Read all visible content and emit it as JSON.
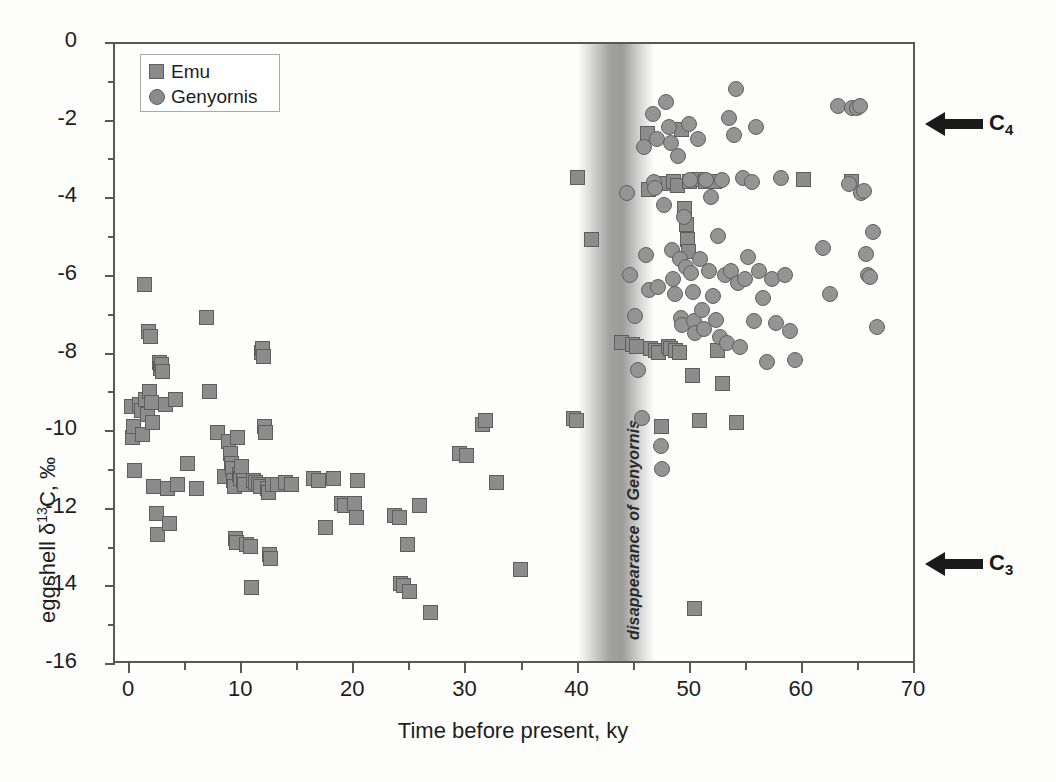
{
  "chart_data": {
    "type": "scatter",
    "title": "",
    "xlabel": "Time before present, ky",
    "ylabel": "eggshell δ13C, ‰",
    "xlim": [
      0,
      70
    ],
    "ylim": [
      -16,
      0
    ],
    "xticks": [
      0,
      10,
      20,
      30,
      40,
      50,
      60,
      70
    ],
    "yticks": [
      0,
      -2,
      -4,
      -6,
      -8,
      -10,
      -12,
      -14,
      -16
    ],
    "xtick_minor_step": 5,
    "ytick_minor_step": 1,
    "grid": false,
    "legend_position": "top-left",
    "series": [
      {
        "name": "Emu",
        "marker": "square",
        "color": "#8c8c8c",
        "points": [
          [
            0.3,
            -9.4
          ],
          [
            0.4,
            -10.2
          ],
          [
            0.5,
            -9.9
          ],
          [
            0.6,
            -11.05
          ],
          [
            1.0,
            -9.35
          ],
          [
            1.2,
            -9.5
          ],
          [
            1.3,
            -10.1
          ],
          [
            1.5,
            -6.25
          ],
          [
            1.6,
            -9.2
          ],
          [
            1.7,
            -9.6
          ],
          [
            1.8,
            -7.45
          ],
          [
            1.9,
            -9.0
          ],
          [
            2.0,
            -7.6
          ],
          [
            2.1,
            -9.3
          ],
          [
            2.2,
            -9.8
          ],
          [
            2.3,
            -11.45
          ],
          [
            2.5,
            -12.15
          ],
          [
            2.6,
            -12.7
          ],
          [
            2.8,
            -8.25
          ],
          [
            2.9,
            -8.4
          ],
          [
            3.0,
            -8.3
          ],
          [
            3.1,
            -8.5
          ],
          [
            3.3,
            -9.35
          ],
          [
            3.5,
            -11.5
          ],
          [
            3.7,
            -12.4
          ],
          [
            4.2,
            -9.2
          ],
          [
            4.4,
            -11.4
          ],
          [
            5.3,
            -10.85
          ],
          [
            6.1,
            -11.5
          ],
          [
            7.0,
            -7.1
          ],
          [
            7.3,
            -9.0
          ],
          [
            8.0,
            -10.05
          ],
          [
            8.6,
            -11.2
          ],
          [
            9.0,
            -10.3
          ],
          [
            9.1,
            -10.6
          ],
          [
            9.2,
            -10.85
          ],
          [
            9.3,
            -11.0
          ],
          [
            9.4,
            -11.3
          ],
          [
            9.5,
            -11.45
          ],
          [
            9.6,
            -12.8
          ],
          [
            9.7,
            -12.9
          ],
          [
            9.8,
            -10.2
          ],
          [
            9.9,
            -11.15
          ],
          [
            10.0,
            -11.25
          ],
          [
            10.1,
            -10.95
          ],
          [
            10.3,
            -11.3
          ],
          [
            10.4,
            -11.4
          ],
          [
            10.6,
            -12.95
          ],
          [
            10.9,
            -13.0
          ],
          [
            11.0,
            -14.05
          ],
          [
            11.2,
            -11.3
          ],
          [
            11.4,
            -11.35
          ],
          [
            11.6,
            -11.4
          ],
          [
            11.8,
            -11.45
          ],
          [
            11.9,
            -8.0
          ],
          [
            12.0,
            -7.9
          ],
          [
            12.1,
            -8.1
          ],
          [
            12.2,
            -9.9
          ],
          [
            12.3,
            -10.05
          ],
          [
            12.4,
            -11.5
          ],
          [
            12.5,
            -11.6
          ],
          [
            12.6,
            -13.2
          ],
          [
            12.7,
            -13.3
          ],
          [
            12.9,
            -11.4
          ],
          [
            13.3,
            -11.4
          ],
          [
            14.0,
            -11.35
          ],
          [
            14.6,
            -11.4
          ],
          [
            16.5,
            -11.25
          ],
          [
            17.0,
            -11.3
          ],
          [
            17.6,
            -12.5
          ],
          [
            18.3,
            -11.25
          ],
          [
            19.0,
            -11.9
          ],
          [
            19.3,
            -11.95
          ],
          [
            20.2,
            -11.9
          ],
          [
            20.4,
            -12.25
          ],
          [
            20.5,
            -11.3
          ],
          [
            23.8,
            -12.2
          ],
          [
            24.2,
            -12.25
          ],
          [
            24.3,
            -13.95
          ],
          [
            24.6,
            -14.0
          ],
          [
            24.9,
            -12.95
          ],
          [
            25.1,
            -14.15
          ],
          [
            26.0,
            -11.95
          ],
          [
            27.0,
            -14.7
          ],
          [
            29.6,
            -10.6
          ],
          [
            30.2,
            -10.65
          ],
          [
            31.6,
            -9.85
          ],
          [
            31.9,
            -9.75
          ],
          [
            32.9,
            -11.35
          ],
          [
            35.0,
            -13.6
          ],
          [
            39.7,
            -9.7
          ],
          [
            40.0,
            -9.75
          ],
          [
            40.1,
            -3.5
          ],
          [
            41.3,
            -5.1
          ],
          [
            44.0,
            -7.75
          ],
          [
            45.0,
            -7.8
          ],
          [
            45.3,
            -7.85
          ],
          [
            46.3,
            -2.35
          ],
          [
            46.4,
            -3.8
          ],
          [
            46.6,
            -7.9
          ],
          [
            47.0,
            -7.95
          ],
          [
            47.3,
            -8.0
          ],
          [
            47.6,
            -9.9
          ],
          [
            48.0,
            -3.65
          ],
          [
            48.2,
            -7.85
          ],
          [
            48.4,
            -7.9
          ],
          [
            48.6,
            -3.6
          ],
          [
            48.8,
            -7.95
          ],
          [
            49.0,
            -3.7
          ],
          [
            49.2,
            -8.0
          ],
          [
            49.4,
            -2.25
          ],
          [
            49.6,
            -4.3
          ],
          [
            49.8,
            -4.7
          ],
          [
            49.9,
            -5.1
          ],
          [
            50.0,
            -5.4
          ],
          [
            50.1,
            -3.6
          ],
          [
            50.3,
            -8.6
          ],
          [
            50.5,
            -14.6
          ],
          [
            50.8,
            -3.55
          ],
          [
            51.0,
            -9.75
          ],
          [
            51.5,
            -3.6
          ],
          [
            52.3,
            -3.6
          ],
          [
            52.6,
            -7.95
          ],
          [
            53.0,
            -8.8
          ],
          [
            54.3,
            -9.8
          ],
          [
            60.2,
            -3.55
          ],
          [
            64.5,
            -3.6
          ]
        ]
      },
      {
        "name": "Genyornis",
        "marker": "circle",
        "color": "#949494",
        "points": [
          [
            44.5,
            -3.9
          ],
          [
            44.8,
            -6.0
          ],
          [
            45.2,
            -7.05
          ],
          [
            45.5,
            -8.45
          ],
          [
            45.8,
            -9.7
          ],
          [
            46.0,
            -2.7
          ],
          [
            46.2,
            -5.5
          ],
          [
            46.5,
            -6.4
          ],
          [
            46.8,
            -1.85
          ],
          [
            46.9,
            -3.6
          ],
          [
            47.0,
            -3.75
          ],
          [
            47.2,
            -2.5
          ],
          [
            47.3,
            -6.3
          ],
          [
            47.5,
            -10.4
          ],
          [
            47.6,
            -11.0
          ],
          [
            47.8,
            -4.2
          ],
          [
            48.0,
            -1.55
          ],
          [
            48.2,
            -2.2
          ],
          [
            48.4,
            -2.6
          ],
          [
            48.5,
            -5.35
          ],
          [
            48.6,
            -6.1
          ],
          [
            48.8,
            -6.5
          ],
          [
            49.0,
            -2.95
          ],
          [
            49.2,
            -5.6
          ],
          [
            49.3,
            -7.1
          ],
          [
            49.4,
            -7.3
          ],
          [
            49.6,
            -4.5
          ],
          [
            49.8,
            -5.8
          ],
          [
            50.0,
            -2.1
          ],
          [
            50.1,
            -3.55
          ],
          [
            50.2,
            -5.95
          ],
          [
            50.4,
            -6.45
          ],
          [
            50.5,
            -7.2
          ],
          [
            50.6,
            -7.5
          ],
          [
            50.8,
            -2.5
          ],
          [
            51.0,
            -5.6
          ],
          [
            51.2,
            -6.9
          ],
          [
            51.4,
            -7.4
          ],
          [
            51.5,
            -3.55
          ],
          [
            51.8,
            -5.9
          ],
          [
            52.0,
            -4.0
          ],
          [
            52.2,
            -6.55
          ],
          [
            52.4,
            -7.15
          ],
          [
            52.6,
            -5.0
          ],
          [
            52.8,
            -7.6
          ],
          [
            53.0,
            -3.55
          ],
          [
            53.2,
            -6.0
          ],
          [
            53.4,
            -7.75
          ],
          [
            53.6,
            -1.95
          ],
          [
            53.8,
            -5.9
          ],
          [
            54.0,
            -2.4
          ],
          [
            54.2,
            -1.2
          ],
          [
            54.4,
            -6.2
          ],
          [
            54.6,
            -7.85
          ],
          [
            54.8,
            -3.5
          ],
          [
            55.0,
            -6.1
          ],
          [
            55.3,
            -5.55
          ],
          [
            55.6,
            -3.6
          ],
          [
            55.8,
            -7.2
          ],
          [
            56.0,
            -2.2
          ],
          [
            56.3,
            -5.9
          ],
          [
            56.6,
            -6.6
          ],
          [
            57.0,
            -8.25
          ],
          [
            57.4,
            -6.1
          ],
          [
            57.8,
            -7.25
          ],
          [
            58.2,
            -3.5
          ],
          [
            58.6,
            -6.0
          ],
          [
            59.0,
            -7.45
          ],
          [
            59.5,
            -8.2
          ],
          [
            62.0,
            -5.3
          ],
          [
            62.6,
            -6.5
          ],
          [
            63.3,
            -1.65
          ],
          [
            64.3,
            -3.65
          ],
          [
            64.6,
            -1.7
          ],
          [
            65.0,
            -1.7
          ],
          [
            65.3,
            -1.65
          ],
          [
            65.4,
            -3.9
          ],
          [
            65.6,
            -3.85
          ],
          [
            65.8,
            -5.45
          ],
          [
            66.0,
            -6.0
          ],
          [
            66.2,
            -6.05
          ],
          [
            66.4,
            -4.9
          ],
          [
            66.8,
            -7.35
          ]
        ]
      }
    ],
    "annotations": [
      {
        "name": "c4-arrow",
        "text": "C4",
        "text_html": "C<sub>4</sub>",
        "x_px": 928,
        "y_px": 122,
        "arrow": "left"
      },
      {
        "name": "c3-arrow",
        "text": "C3",
        "text_html": "C<sub>3</sub>",
        "x_px": 928,
        "y_px": 562,
        "arrow": "left"
      },
      {
        "name": "disappearance-band",
        "text": "disappearance of Genyornis",
        "x_center_ky": 43.5,
        "width_ky": 2.6
      }
    ]
  },
  "axes": {
    "x": {
      "title": "Time before present, ky",
      "tick_labels": [
        "0",
        "10",
        "20",
        "30",
        "40",
        "50",
        "60",
        "70"
      ]
    },
    "y": {
      "title_prefix": "eggshell δ",
      "title_sup": "13",
      "title_suffix": "C, ‰",
      "tick_labels": [
        "0",
        "-2",
        "-4",
        "-6",
        "-8",
        "-10",
        "-12",
        "-14",
        "-16"
      ]
    }
  },
  "legend": {
    "items": [
      {
        "label": "Emu",
        "marker": "square"
      },
      {
        "label": "Genyornis",
        "marker": "circle"
      }
    ]
  },
  "band": {
    "label": "disappearance of Genyornis"
  },
  "annotations": {
    "c4_label": "C",
    "c4_sub": "4",
    "c3_label": "C",
    "c3_sub": "3"
  },
  "colors": {
    "emu_fill": "#8c8c8c",
    "emu_stroke": "#5e5e5e",
    "genyornis_fill": "#949494",
    "genyornis_stroke": "#606060",
    "axis": "#58585a",
    "band": "#6a6a6a",
    "text": "#1d1d1d"
  }
}
